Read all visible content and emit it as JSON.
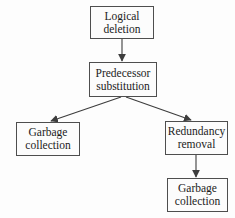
{
  "diagram": {
    "nodes": [
      {
        "id": "logical-deletion",
        "label": "Logical deletion"
      },
      {
        "id": "predecessor-substitution",
        "label": "Predecessor substitution"
      },
      {
        "id": "garbage-collection-left",
        "label": "Garbage collection"
      },
      {
        "id": "redundancy-removal",
        "label": "Redundancy removal"
      },
      {
        "id": "garbage-collection-right",
        "label": "Garbage collection"
      }
    ],
    "edges": [
      {
        "from": "logical-deletion",
        "to": "predecessor-substitution"
      },
      {
        "from": "predecessor-substitution",
        "to": "garbage-collection-left"
      },
      {
        "from": "predecessor-substitution",
        "to": "redundancy-removal"
      },
      {
        "from": "redundancy-removal",
        "to": "garbage-collection-right"
      }
    ],
    "clipped_edge_text": "r",
    "colors": {
      "background": "#fdfdfd",
      "node_border": "#4e4e4e",
      "node_fill": "#fcfcfc",
      "text": "#1b1b1b",
      "arrow": "#3d3d3d"
    }
  }
}
